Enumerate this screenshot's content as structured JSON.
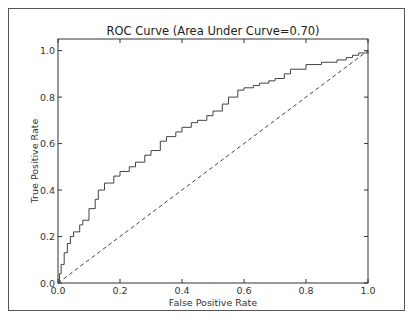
{
  "chart_data": {
    "type": "line",
    "title": "ROC Curve (Area Under Curve=0.70)",
    "xlabel": "False Positive Rate",
    "ylabel": "True Positive Rate",
    "xlim": [
      0.0,
      1.0
    ],
    "ylim": [
      0.0,
      1.05
    ],
    "xticks": [
      "0.0",
      "0.2",
      "0.4",
      "0.6",
      "0.8",
      "1.0"
    ],
    "yticks": [
      "0.0",
      "0.2",
      "0.4",
      "0.6",
      "0.8",
      "1.0"
    ],
    "grid": false,
    "legend": null,
    "series": [
      {
        "name": "ROC curve",
        "style": "solid",
        "color": "#444444",
        "x": [
          0.0,
          0.005,
          0.01,
          0.02,
          0.03,
          0.04,
          0.05,
          0.07,
          0.08,
          0.1,
          0.12,
          0.13,
          0.15,
          0.18,
          0.2,
          0.23,
          0.25,
          0.28,
          0.3,
          0.33,
          0.35,
          0.38,
          0.4,
          0.43,
          0.45,
          0.48,
          0.5,
          0.53,
          0.55,
          0.58,
          0.6,
          0.63,
          0.65,
          0.68,
          0.7,
          0.73,
          0.75,
          0.8,
          0.85,
          0.88,
          0.9,
          0.93,
          0.95,
          0.97,
          1.0
        ],
        "y": [
          0.0,
          0.04,
          0.08,
          0.13,
          0.17,
          0.2,
          0.22,
          0.25,
          0.27,
          0.32,
          0.36,
          0.4,
          0.43,
          0.46,
          0.48,
          0.5,
          0.52,
          0.55,
          0.57,
          0.61,
          0.63,
          0.65,
          0.67,
          0.69,
          0.7,
          0.72,
          0.74,
          0.77,
          0.8,
          0.83,
          0.84,
          0.85,
          0.86,
          0.87,
          0.88,
          0.9,
          0.92,
          0.94,
          0.95,
          0.95,
          0.96,
          0.97,
          0.98,
          0.99,
          1.0
        ]
      },
      {
        "name": "Random classifier",
        "style": "dashed",
        "color": "#444444",
        "x": [
          0.0,
          1.0
        ],
        "y": [
          0.0,
          1.0
        ]
      }
    ],
    "auc": 0.7
  }
}
